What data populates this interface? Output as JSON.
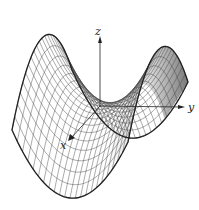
{
  "figure": {
    "surface": "z = y^2 - x^2",
    "axes": {
      "x": {
        "label": "x"
      },
      "y": {
        "label": "y"
      },
      "z": {
        "label": "z"
      }
    },
    "colors": {
      "background": "#ffffff",
      "mesh": "#444444",
      "outline": "#222222",
      "shade": "#9a9a9a"
    },
    "mesh": {
      "u_lines": 22,
      "v_lines": 22
    }
  }
}
